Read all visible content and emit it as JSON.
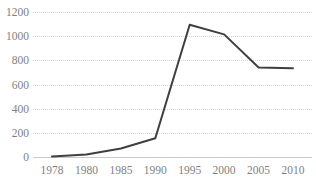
{
  "chart_data": {
    "type": "line",
    "title": "",
    "xlabel": "",
    "ylabel": "",
    "categories": [
      "1978",
      "1980",
      "1985",
      "1990",
      "1995",
      "2000",
      "2005",
      "2010"
    ],
    "values": [
      5,
      20,
      70,
      155,
      1095,
      1015,
      740,
      735
    ],
    "series": [
      {
        "name": "",
        "values": [
          5,
          20,
          70,
          155,
          1095,
          1015,
          740,
          735
        ]
      }
    ],
    "ylim": [
      0,
      1200
    ],
    "ytick_labels": [
      "0",
      "200",
      "400",
      "600",
      "800",
      "1000",
      "1200"
    ],
    "ytick_values": [
      0,
      200,
      400,
      600,
      800,
      1000,
      1200
    ],
    "grid": true,
    "legend": false,
    "legend_position": "none",
    "line_color": "#3f3f3f",
    "grid_color": "#d6d6d6",
    "axis_color": "#c9c9c9",
    "tick_label_color": "#7f7f7f",
    "background": "#ffffff"
  }
}
